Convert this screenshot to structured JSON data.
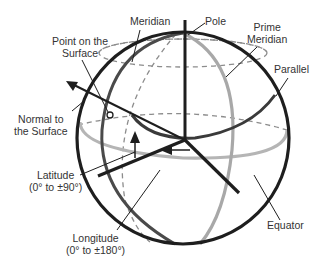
{
  "diagram": {
    "labels": {
      "meridian": "Meridian",
      "pole": "Pole",
      "prime_meridian_line1": "Prime",
      "prime_meridian_line2": "Meridian",
      "parallel": "Parallel",
      "point_line1": "Point on the",
      "point_line2": "Surface",
      "normal_line1": "Normal to",
      "normal_line2": "the Surface",
      "latitude_line1": "Latitude",
      "latitude_line2": "(0° to ±90°)",
      "longitude_line1": "Longitude",
      "longitude_line2": "(0° to ±180°)",
      "equator": "Equator"
    },
    "colors": {
      "outline": "#1e1e1e",
      "meridian": "#4a4a4a",
      "prime_meridian": "#a8a8a8",
      "equator": "#b5b5b5",
      "dashed": "#8c8c8c",
      "text": "#333333"
    }
  }
}
